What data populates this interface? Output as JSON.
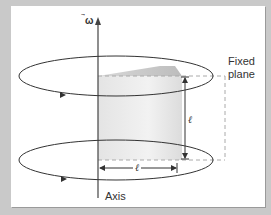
{
  "diagram": {
    "omega_label": "ω",
    "fixed_plane_label_line1": "Fixed",
    "fixed_plane_label_line2": "plane",
    "axis_label": "Axis",
    "height_label": "ℓ",
    "radius_label": "ℓ"
  },
  "colors": {
    "background": "#c9c9c9",
    "panel": "#ffffff",
    "lines": "#333333",
    "dashed": "#aaaaaa",
    "shade": "#d8d8d8"
  }
}
